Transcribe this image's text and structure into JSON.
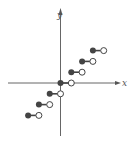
{
  "chart_data": {
    "type": "line",
    "title": "",
    "xlabel": "x",
    "ylabel": "y",
    "grid": false,
    "xlim": [
      -5.5,
      5.5
    ],
    "ylim": [
      -5,
      6.5
    ],
    "series": [
      {
        "name": "floor(x)",
        "segments": [
          {
            "x_start": -3,
            "x_end": -2,
            "y": -3,
            "start": "closed",
            "end": "open"
          },
          {
            "x_start": -2,
            "x_end": -1,
            "y": -2,
            "start": "closed",
            "end": "open"
          },
          {
            "x_start": -1,
            "x_end": 0,
            "y": -1,
            "start": "closed",
            "end": "open"
          },
          {
            "x_start": 0,
            "x_end": 1,
            "y": 0,
            "start": "closed",
            "end": "open"
          },
          {
            "x_start": 1,
            "x_end": 2,
            "y": 1,
            "start": "closed",
            "end": "open"
          },
          {
            "x_start": 2,
            "x_end": 3,
            "y": 2,
            "start": "closed",
            "end": "open"
          },
          {
            "x_start": 3,
            "x_end": 4,
            "y": 3,
            "start": "closed",
            "end": "open"
          }
        ]
      }
    ]
  },
  "axes": {
    "x_label": "x",
    "y_label": "y"
  },
  "colors": {
    "axis": "#555555",
    "segment": "#444444",
    "open_fill": "#ffffff"
  }
}
